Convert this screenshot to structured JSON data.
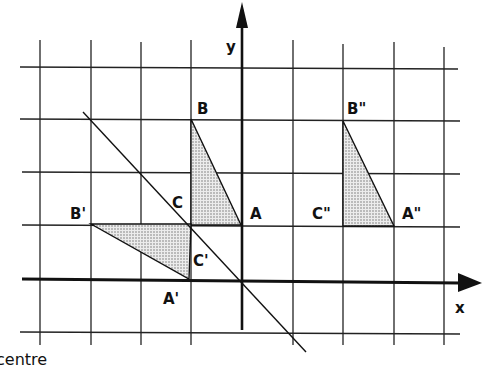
{
  "diagram": {
    "type": "coordinate-grid-transformations",
    "axes": {
      "x_label": "x",
      "y_label": "y"
    },
    "grid": {
      "columns": 8,
      "rows": 5
    },
    "triangles": [
      {
        "name": "ABC",
        "vertices": {
          "A": "A",
          "B": "B",
          "C": "C"
        },
        "shaded": true
      },
      {
        "name": "A'B'C'",
        "vertices": {
          "A": "A'",
          "B": "B'",
          "C": "C'"
        },
        "shaded": true
      },
      {
        "name": "A''B''C''",
        "vertices": {
          "A": "A\"",
          "B": "B\"",
          "C": "C\""
        },
        "shaded": true
      }
    ],
    "labels": {
      "A": "A",
      "B": "B",
      "C": "C",
      "A1": "A'",
      "B1": "B'",
      "C1": "C'",
      "A2": "A\"",
      "B2": "B\"",
      "C2": "C\""
    },
    "reflection_line": "diagonal line through origin (y = -x)",
    "caption_partial": "centre"
  },
  "colors": {
    "ink": "#111111",
    "shade": "#d8d8d8",
    "background": "#ffffff"
  }
}
